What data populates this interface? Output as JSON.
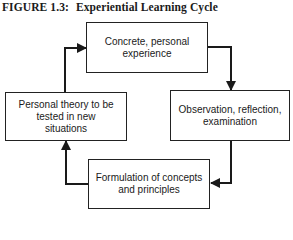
{
  "figure": {
    "label": "FIGURE 1.3:",
    "title": "Experiential Learning Cycle"
  },
  "nodes": [
    {
      "id": "concrete-experience",
      "text": "Concrete, personal experience"
    },
    {
      "id": "observation-reflection",
      "text": "Observation, reflection, examination"
    },
    {
      "id": "formulation-concepts",
      "text": "Formulation of concepts and principles"
    },
    {
      "id": "personal-theory",
      "text": "Personal theory to be tested in new situations"
    }
  ],
  "edges": [
    {
      "from": "concrete-experience",
      "to": "observation-reflection"
    },
    {
      "from": "observation-reflection",
      "to": "formulation-concepts"
    },
    {
      "from": "formulation-concepts",
      "to": "personal-theory"
    },
    {
      "from": "personal-theory",
      "to": "concrete-experience"
    }
  ],
  "colors": {
    "line": "#1a1a1a",
    "background": "#ffffff"
  }
}
